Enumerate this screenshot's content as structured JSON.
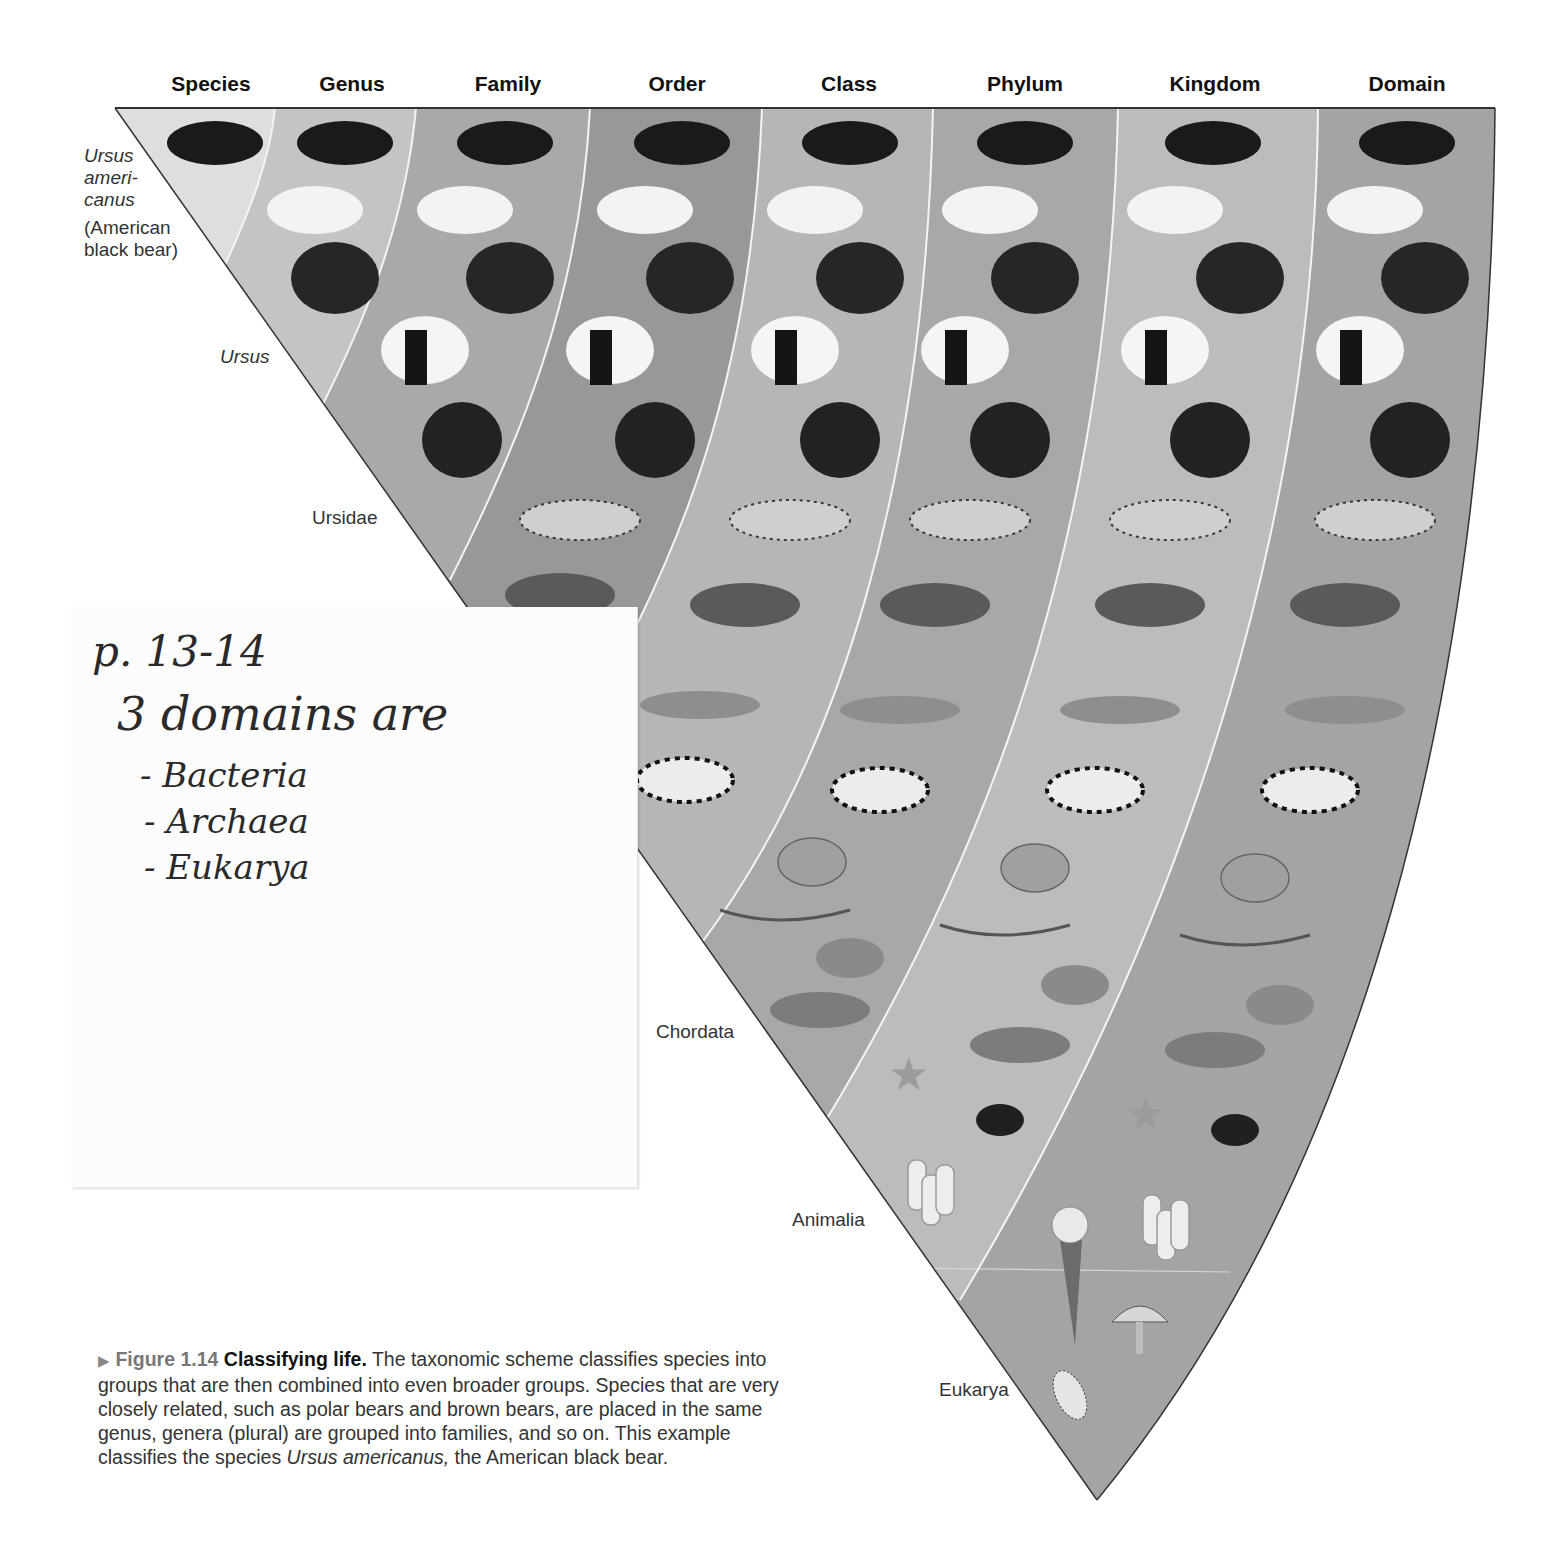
{
  "figure": {
    "columns": [
      {
        "label": "Species",
        "x": 211
      },
      {
        "label": "Genus",
        "x": 352
      },
      {
        "label": "Family",
        "x": 508
      },
      {
        "label": "Order",
        "x": 677
      },
      {
        "label": "Class",
        "x": 849
      },
      {
        "label": "Phylum",
        "x": 1025
      },
      {
        "label": "Kingdom",
        "x": 1215
      },
      {
        "label": "Domain",
        "x": 1407
      }
    ],
    "group_labels": [
      {
        "text_lines": [
          "Ursus",
          "ameri-",
          "canus"
        ],
        "italic": true,
        "x": 84,
        "y": 145
      },
      {
        "text_lines": [
          "(American",
          "black bear)"
        ],
        "italic": false,
        "x": 84,
        "y": 217
      },
      {
        "text_lines": [
          "Ursus"
        ],
        "italic": true,
        "x": 220,
        "y": 346
      },
      {
        "text_lines": [
          "Ursidae"
        ],
        "italic": false,
        "x": 312,
        "y": 507
      },
      {
        "text_lines": [
          "Chordata"
        ],
        "italic": false,
        "x": 656,
        "y": 1021
      },
      {
        "text_lines": [
          "Animalia"
        ],
        "italic": false,
        "x": 792,
        "y": 1209
      },
      {
        "text_lines": [
          "Eukarya"
        ],
        "italic": false,
        "x": 939,
        "y": 1379
      }
    ],
    "band_colors": [
      "#dcdcdc",
      "#c3c3c3",
      "#a9a9a9",
      "#9a9a9a",
      "#b8b8b8",
      "#a6a6a6",
      "#bebebe",
      "#a4a4a4"
    ],
    "organisms": [
      "american-black-bear",
      "polar-bear",
      "brown-bear",
      "giant-panda",
      "spectacled-bear",
      "leopard",
      "gray-wolf",
      "dolphin",
      "zebra",
      "frog",
      "gull",
      "tortoise",
      "fish",
      "sea-star",
      "monarch-butterfly",
      "sponge",
      "daffodil",
      "mushroom",
      "paramecium"
    ]
  },
  "sticky_note": {
    "lines": [
      "p. 13-14",
      "3 domains are",
      "- Bacteria",
      "- Archaea",
      "- Eukarya"
    ]
  },
  "caption": {
    "arrow": "▶",
    "figure_number": "Figure 1.14",
    "title": "Classifying life.",
    "body_part1": "The taxonomic scheme classifies species into groups that are then combined into even broader groups. Species that are very closely related, such as polar bears and brown bears, are placed in the same genus, genera (plural) are grouped into families, and so on. This example classifies the species",
    "species_italic": "Ursus americanus,",
    "body_part2": "the American black bear."
  }
}
